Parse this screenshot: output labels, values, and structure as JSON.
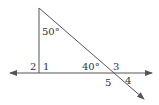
{
  "diagram": {
    "type": "geometry",
    "labels": {
      "angle_top": "50°",
      "angle_bottom_right": "40°",
      "angle_1": "1",
      "angle_2": "2",
      "angle_3": "3",
      "angle_4": "4",
      "angle_5": "5"
    },
    "colors": {
      "line": "#555555",
      "text": "#333333",
      "background": "#ffffff"
    }
  }
}
